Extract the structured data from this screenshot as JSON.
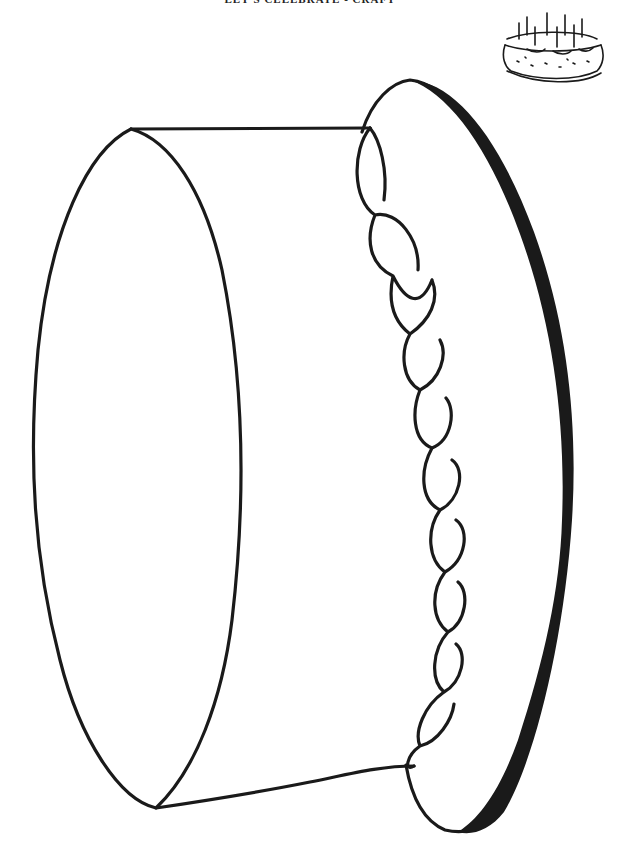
{
  "header": {
    "title": "LET'S CELEBRATE - CRAFT"
  },
  "illustration": {
    "subject": "birthday cake coloring outline",
    "icon": "cake-with-candles-icon",
    "stroke_color": "#1a1a1a",
    "background_color": "#ffffff"
  }
}
